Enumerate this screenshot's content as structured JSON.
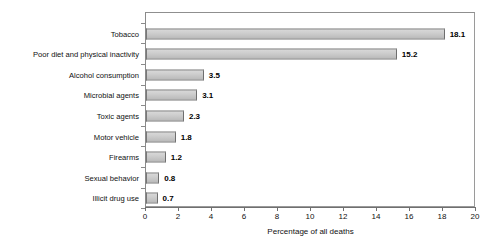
{
  "chart_data": {
    "type": "bar",
    "orientation": "horizontal",
    "title": "",
    "xlabel": "Percentage of all deaths",
    "ylabel": "",
    "xlim": [
      0,
      20
    ],
    "xticks": [
      0,
      2,
      4,
      6,
      8,
      10,
      12,
      14,
      16,
      18,
      20
    ],
    "grid": false,
    "legend": false,
    "categories": [
      "Tobacco",
      "Poor diet and physical inactivity",
      "Alcohol consumption",
      "Microbial agents",
      "Toxic agents",
      "Motor vehicle",
      "Firearms",
      "Sexual behavior",
      "Illicit drug use"
    ],
    "values": [
      18.1,
      15.2,
      3.5,
      3.1,
      2.3,
      1.8,
      1.2,
      0.8,
      0.7
    ],
    "value_labels": [
      "18.1",
      "15.2",
      "3.5",
      "3.1",
      "2.3",
      "1.8",
      "1.2",
      "0.8",
      "0.7"
    ],
    "bar_color": "#c8c8c8",
    "bar_edge_color": "#777777",
    "axis_color": "#8a8a8a"
  }
}
